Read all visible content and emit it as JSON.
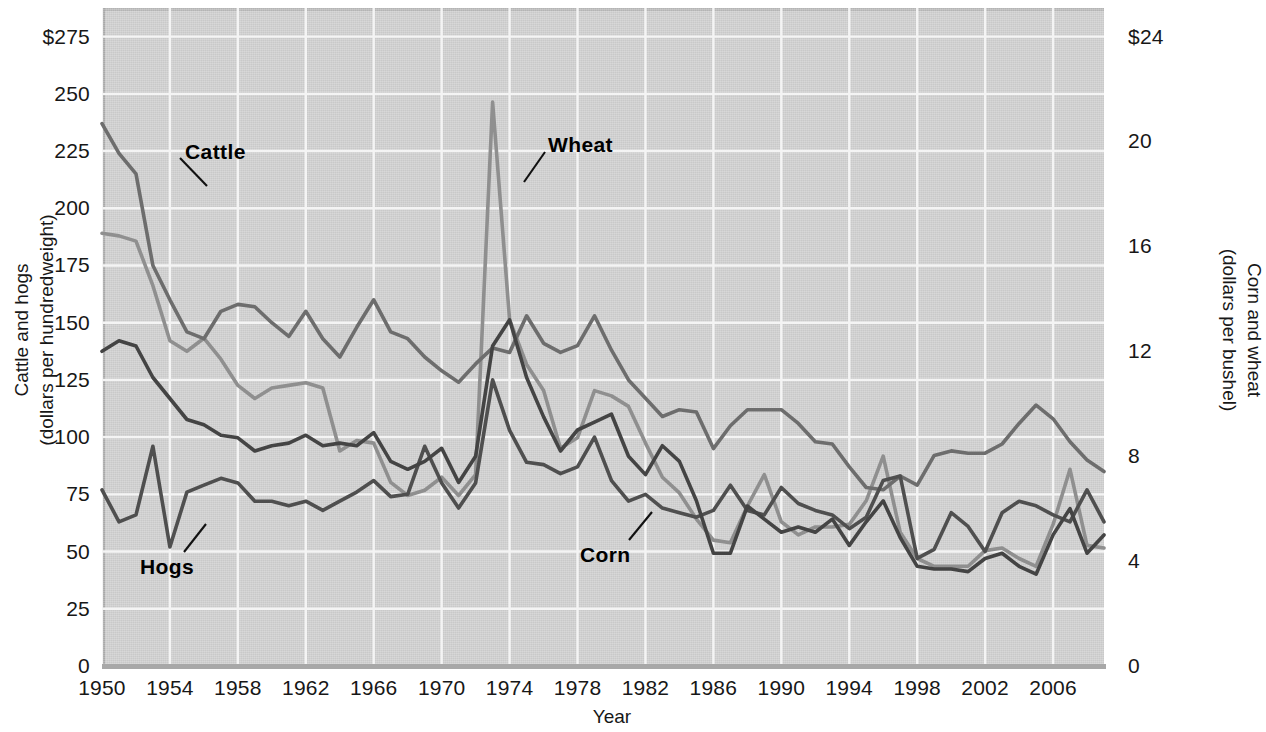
{
  "chart_data": {
    "type": "line",
    "title": "",
    "xlabel": "Year",
    "ylabel": "Cattle and hogs\n(dollars per hundredweight)",
    "y2label": "Corn and wheat\n(dollars per bushel)",
    "grid": true,
    "legend_position": "inline-annotations",
    "xlim": [
      1950,
      2009
    ],
    "ylim": [
      0,
      287.5
    ],
    "y2lim": [
      0,
      25.09
    ],
    "xticks": [
      "1950",
      "1954",
      "1958",
      "1962",
      "1966",
      "1970",
      "1974",
      "1978",
      "1982",
      "1986",
      "1990",
      "1994",
      "1998",
      "2002",
      "2006"
    ],
    "xtick_values": [
      1950,
      1954,
      1958,
      1962,
      1966,
      1970,
      1974,
      1978,
      1982,
      1986,
      1990,
      1994,
      1998,
      2002,
      2006
    ],
    "yticks_left": [
      "0",
      "25",
      "50",
      "75",
      "100",
      "125",
      "150",
      "175",
      "200",
      "225",
      "250",
      "$275"
    ],
    "ytick_values_left": [
      0,
      25,
      50,
      75,
      100,
      125,
      150,
      175,
      200,
      225,
      250,
      275
    ],
    "yticks_right": [
      "0",
      "4",
      "8",
      "12",
      "16",
      "20",
      "$24"
    ],
    "ytick_values_right": [
      0,
      4,
      8,
      12,
      16,
      20,
      24
    ],
    "x": [
      1950,
      1951,
      1952,
      1953,
      1954,
      1955,
      1956,
      1957,
      1958,
      1959,
      1960,
      1961,
      1962,
      1963,
      1964,
      1965,
      1966,
      1967,
      1968,
      1969,
      1970,
      1971,
      1972,
      1973,
      1974,
      1975,
      1976,
      1977,
      1978,
      1979,
      1980,
      1981,
      1982,
      1983,
      1984,
      1985,
      1986,
      1987,
      1988,
      1989,
      1990,
      1991,
      1992,
      1993,
      1994,
      1995,
      1996,
      1997,
      1998,
      1999,
      2000,
      2001,
      2002,
      2003,
      2004,
      2005,
      2006,
      2007,
      2008,
      2009
    ],
    "series": [
      {
        "name": "Cattle",
        "axis": "left",
        "color": "#6d6d6d",
        "units": "dollars per hundredweight",
        "values": [
          237,
          224,
          215,
          175,
          160,
          146,
          143,
          155,
          158,
          157,
          150,
          144,
          155,
          143,
          135,
          148,
          160,
          146,
          143,
          135,
          129,
          124,
          132,
          139,
          137,
          153,
          141,
          137,
          140,
          153,
          138,
          125,
          117,
          109,
          112,
          111,
          95,
          105,
          112,
          112,
          112,
          106,
          98,
          97,
          87,
          78,
          77,
          83,
          79,
          92,
          94,
          93,
          93,
          97,
          106,
          114,
          108,
          98,
          90,
          85
        ]
      },
      {
        "name": "Hogs",
        "axis": "left",
        "color": "#4f4f4f",
        "units": "dollars per hundredweight",
        "values": [
          77,
          63,
          66,
          96,
          52,
          76,
          79,
          82,
          80,
          72,
          72,
          70,
          72,
          68,
          72,
          76,
          81,
          74,
          75,
          96,
          80,
          69,
          80,
          125,
          103,
          89,
          88,
          84,
          87,
          100,
          81,
          72,
          75,
          69,
          67,
          65,
          68,
          79,
          68,
          66,
          78,
          71,
          68,
          66,
          60,
          65,
          81,
          83,
          47,
          51,
          67,
          61,
          50,
          67,
          72,
          70,
          66,
          63,
          77,
          63
        ]
      },
      {
        "name": "Wheat",
        "axis": "right",
        "color": "#8f8f8f",
        "units": "dollars per bushel",
        "values": [
          16.5,
          16.4,
          16.2,
          14.5,
          12.4,
          12.0,
          12.5,
          11.7,
          10.7,
          10.2,
          10.6,
          10.7,
          10.8,
          10.6,
          8.2,
          8.6,
          8.5,
          7.0,
          6.5,
          6.7,
          7.2,
          6.5,
          7.3,
          21.5,
          13.2,
          11.5,
          10.5,
          8.3,
          8.7,
          10.5,
          10.3,
          9.9,
          8.5,
          7.2,
          6.6,
          5.6,
          4.8,
          4.7,
          6.1,
          7.3,
          5.5,
          5.0,
          5.3,
          5.3,
          5.4,
          6.3,
          8.0,
          5.1,
          4.1,
          3.8,
          3.8,
          3.8,
          4.4,
          4.5,
          4.1,
          3.8,
          5.4,
          7.5,
          4.6,
          4.5
        ]
      },
      {
        "name": "Corn",
        "axis": "right",
        "color": "#444444",
        "units": "dollars per bushel",
        "values": [
          12.0,
          12.4,
          12.2,
          11.0,
          10.2,
          9.4,
          9.2,
          8.8,
          8.7,
          8.2,
          8.4,
          8.5,
          8.8,
          8.4,
          8.5,
          8.4,
          8.9,
          7.8,
          7.5,
          7.8,
          8.3,
          7.0,
          8.0,
          12.2,
          13.2,
          11.0,
          9.5,
          8.2,
          9.0,
          9.3,
          9.6,
          8.0,
          7.3,
          8.4,
          7.8,
          6.3,
          4.3,
          4.3,
          6.1,
          5.6,
          5.1,
          5.3,
          5.1,
          5.6,
          4.6,
          5.5,
          6.3,
          4.9,
          3.8,
          3.7,
          3.7,
          3.6,
          4.1,
          4.3,
          3.8,
          3.5,
          5.0,
          6.0,
          4.3,
          5.0
        ]
      }
    ],
    "annotations": [
      {
        "text": "Cattle",
        "x": 185,
        "y": 140
      },
      {
        "text": "Wheat",
        "x": 548,
        "y": 133
      },
      {
        "text": "Hogs",
        "x": 140,
        "y": 555
      },
      {
        "text": "Corn",
        "x": 580,
        "y": 543
      }
    ]
  }
}
